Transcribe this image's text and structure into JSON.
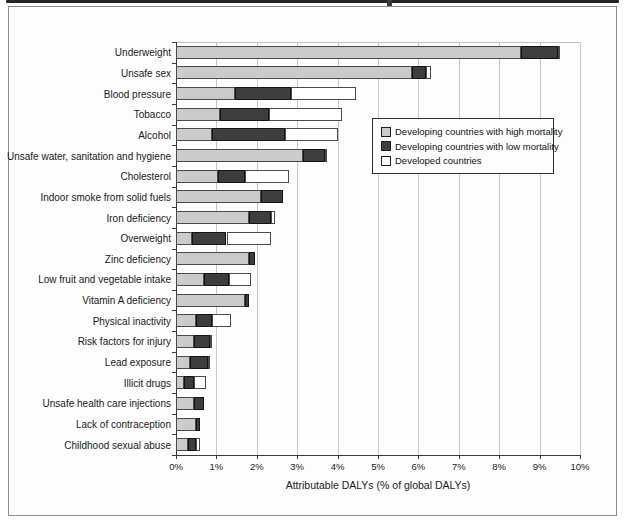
{
  "chart_data": {
    "type": "bar",
    "orientation": "horizontal",
    "stacked": true,
    "grid": true,
    "xlabel": "Attributable DALYs (% of global DALYs)",
    "xlim": [
      0,
      10
    ],
    "x_ticks": [
      "0%",
      "1%",
      "2%",
      "3%",
      "4%",
      "5%",
      "6%",
      "7%",
      "8%",
      "9%",
      "10%"
    ],
    "legend_position": "center-right",
    "categories": [
      "Underweight",
      "Unsafe sex",
      "Blood pressure",
      "Tobacco",
      "Alcohol",
      "Unsafe water, sanitation and hygiene",
      "Cholesterol",
      "Indoor smoke from solid fuels",
      "Iron deficiency",
      "Overweight",
      "Zinc deficiency",
      "Low fruit and vegetable intake",
      "Vitamin A deficiency",
      "Physical inactivity",
      "Risk factors for injury",
      "Lead exposure",
      "Illicit drugs",
      "Unsafe health care injections",
      "Lack of contraception",
      "Childhood sexual abuse"
    ],
    "series": [
      {
        "name": "Developing countries with high mortality",
        "color": "#cbcbcb",
        "values": [
          8.55,
          5.85,
          1.45,
          1.1,
          0.9,
          3.15,
          1.05,
          2.1,
          1.8,
          0.4,
          1.8,
          0.7,
          1.7,
          0.5,
          0.45,
          0.35,
          0.2,
          0.45,
          0.5,
          0.3
        ]
      },
      {
        "name": "Developing countries with low mortality",
        "color": "#3d3d3d",
        "values": [
          0.9,
          0.35,
          1.4,
          1.2,
          1.8,
          0.55,
          0.65,
          0.55,
          0.55,
          0.85,
          0.15,
          0.6,
          0.1,
          0.4,
          0.4,
          0.45,
          0.25,
          0.25,
          0.1,
          0.2
        ]
      },
      {
        "name": "Developed countries",
        "color": "#ffffff",
        "values": [
          0.05,
          0.1,
          1.6,
          1.8,
          1.3,
          0.05,
          1.1,
          0.0,
          0.1,
          1.1,
          0.0,
          0.55,
          0.0,
          0.45,
          0.05,
          0.05,
          0.3,
          0.0,
          0.0,
          0.1
        ]
      }
    ]
  },
  "colors": {
    "grid": "#c9c9c9",
    "axis": "#3a3a3a",
    "figure_border": "#8d8d8d",
    "background": "#fdfdfd"
  }
}
